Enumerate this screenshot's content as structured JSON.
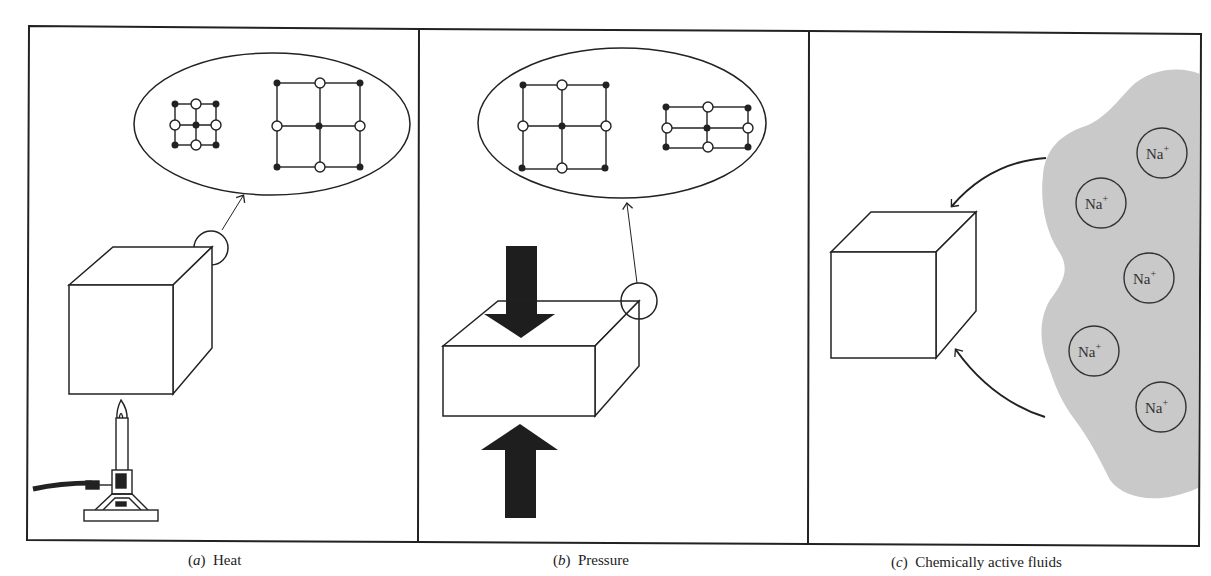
{
  "figure": {
    "panels": [
      {
        "id": "a",
        "caption_letter": "a",
        "caption_text": "Heat",
        "agent": "heat",
        "icons": [
          "cube-icon",
          "magnify-circle-icon",
          "crystal-lattice-small-icon",
          "crystal-lattice-expanded-icon",
          "bunsen-burner-icon",
          "flame-icon"
        ],
        "lattice_zoom": {
          "left": "small lattice",
          "right": "expanded lattice"
        }
      },
      {
        "id": "b",
        "caption_letter": "b",
        "caption_text": "Pressure",
        "agent": "pressure",
        "icons": [
          "flattened-block-icon",
          "magnify-circle-icon",
          "down-arrow-icon",
          "up-arrow-icon",
          "crystal-lattice-square-icon",
          "crystal-lattice-compressed-icon"
        ],
        "lattice_zoom": {
          "left": "square lattice",
          "right": "compressed lattice"
        }
      },
      {
        "id": "c",
        "caption_letter": "c",
        "caption_text": "Chemically active fluids",
        "agent": "fluids",
        "icons": [
          "cube-icon",
          "fluid-region-icon",
          "curved-arrow-icon"
        ],
        "ions": [
          {
            "symbol": "Na",
            "charge": "+"
          },
          {
            "symbol": "Na",
            "charge": "+"
          },
          {
            "symbol": "Na",
            "charge": "+"
          },
          {
            "symbol": "Na",
            "charge": "+"
          },
          {
            "symbol": "Na",
            "charge": "+"
          }
        ]
      }
    ],
    "colors": {
      "line": "#222222",
      "arrow_fill": "#1e1e1e",
      "fluid_fill": "#c9c9c9",
      "background": "#ffffff"
    }
  }
}
